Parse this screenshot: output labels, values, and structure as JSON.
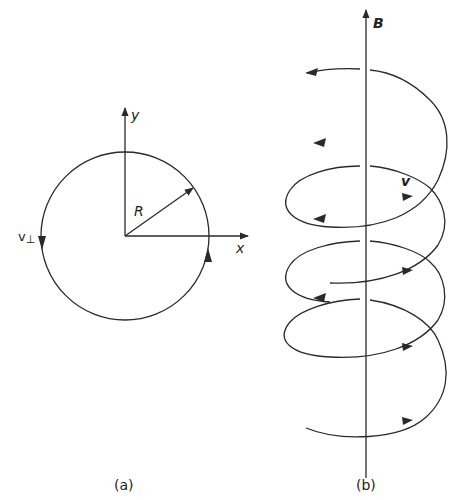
{
  "panel_a": {
    "caption": "(a)",
    "axis_x_label": "x",
    "axis_y_label": "y",
    "radius_label": "R",
    "velocity_label": "v",
    "velocity_subscript": "⊥"
  },
  "panel_b": {
    "caption": "(b)",
    "field_label": "B",
    "velocity_label": "v"
  },
  "colors": {
    "stroke": "#2a2a2a",
    "background": "#ffffff"
  }
}
